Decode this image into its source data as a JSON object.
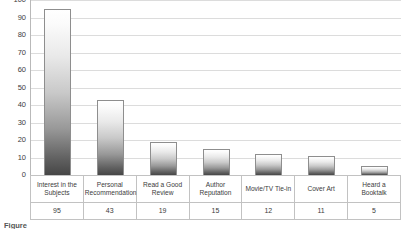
{
  "chart_data": {
    "type": "bar",
    "title": "",
    "subtitle": "",
    "xlabel": "",
    "ylabel": "",
    "ylim": [
      0,
      100
    ],
    "ytick_step": 10,
    "yticks": [
      100,
      90,
      80,
      70,
      60,
      50,
      40,
      30,
      20,
      10,
      0
    ],
    "grid": true,
    "legend": false,
    "categories": [
      "Interest in the Subjects",
      "Personal Recommendation",
      "Read a Good Review",
      "Author Reputation",
      "Movie/TV Tie-in",
      "Cover Art",
      "Heard a Booktalk"
    ],
    "category_lines": [
      [
        "Interest in the",
        "Subjects"
      ],
      [
        "Personal",
        "Recommendation"
      ],
      [
        "Read a Good",
        "Review"
      ],
      [
        "Author",
        "Reputation"
      ],
      [
        "Movie/TV Tie-in",
        ""
      ],
      [
        "Cover Art",
        ""
      ],
      [
        "Heard a Booktalk",
        ""
      ]
    ],
    "values": [
      95,
      43,
      19,
      15,
      12,
      11,
      5
    ],
    "value_labels": [
      "95",
      "43",
      "19",
      "15",
      "12",
      "11",
      "5"
    ],
    "colors": {
      "bar_top": "#ffffff",
      "bar_bottom": "#464646",
      "bar_border": "#8e8e8e",
      "gridline": "#dcdcdc",
      "axis": "#b9b9b9",
      "table_border": "#c2c2c2",
      "text": "#3c3c3c"
    }
  },
  "caption": {
    "label": "Figure",
    "text": ""
  }
}
